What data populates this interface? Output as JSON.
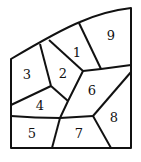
{
  "diagram": {
    "regions": [
      {
        "id": "1",
        "label": "1",
        "x": 77,
        "y": 53
      },
      {
        "id": "2",
        "label": "2",
        "x": 63,
        "y": 78
      },
      {
        "id": "3",
        "label": "3",
        "x": 26,
        "y": 80
      },
      {
        "id": "4",
        "label": "4",
        "x": 40,
        "y": 110
      },
      {
        "id": "5",
        "label": "5",
        "x": 32,
        "y": 138
      },
      {
        "id": "6",
        "label": "6",
        "x": 92,
        "y": 95
      },
      {
        "id": "7",
        "label": "7",
        "x": 79,
        "y": 138
      },
      {
        "id": "8",
        "label": "8",
        "x": 114,
        "y": 122
      },
      {
        "id": "9",
        "label": "9",
        "x": 111,
        "y": 40
      }
    ]
  }
}
